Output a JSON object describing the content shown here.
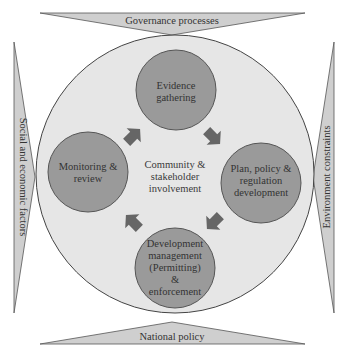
{
  "diagram": {
    "title": "",
    "colors": {
      "background": "#ffffff",
      "outer_band_fill": "#cfcfcf",
      "outer_band_stroke": "#555555",
      "big_circle_fill": "#e6e6e6",
      "big_circle_stroke": "#444444",
      "node_fill": "#9a9a9a",
      "node_stroke": "#555555",
      "arrow_fill": "#666666",
      "text": "#333333"
    },
    "bands": {
      "top": "Governance processes",
      "bottom": "National policy",
      "left": "Social and economic factors",
      "right": "Environment constraints"
    },
    "center": {
      "lines": [
        "Community &",
        "stakeholder",
        "involvement"
      ]
    },
    "nodes": [
      {
        "id": "evidence",
        "lines": [
          "Evidence",
          "gathering"
        ]
      },
      {
        "id": "plan",
        "lines": [
          "Plan, policy &",
          "regulation",
          "development"
        ]
      },
      {
        "id": "development",
        "lines": [
          "Development",
          "management",
          "(Permitting)",
          "&",
          "enforcement"
        ]
      },
      {
        "id": "monitoring",
        "lines": [
          "Monitoring &",
          "review"
        ]
      }
    ],
    "arrows": [
      {
        "from": "evidence",
        "to": "plan",
        "direction": "down-right"
      },
      {
        "from": "plan",
        "to": "development",
        "direction": "down-left"
      },
      {
        "from": "development",
        "to": "monitoring",
        "direction": "up-left"
      },
      {
        "from": "monitoring",
        "to": "evidence",
        "direction": "up-right"
      }
    ]
  }
}
